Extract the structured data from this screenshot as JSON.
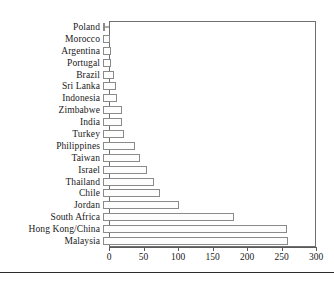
{
  "chart_data": {
    "type": "bar",
    "orientation": "horizontal",
    "title": "",
    "subtitle": "",
    "xlabel": "",
    "ylabel": "",
    "xlim": [
      0,
      300
    ],
    "ylim": null,
    "grid": false,
    "legend": null,
    "xticks": [
      0,
      50,
      100,
      150,
      200,
      250,
      300
    ],
    "xtick_labels": [
      "0",
      "50",
      "100",
      "150",
      "200",
      "250",
      "300"
    ],
    "categories": [
      "Poland",
      "Morocco",
      "Argentina",
      "Portugal",
      "Brazil",
      "Sri Lanka",
      "Indonesia",
      "Zimbabwe",
      "India",
      "Turkey",
      "Philippines",
      "Taiwan",
      "Israel",
      "Thailand",
      "Chile",
      "Jordan",
      "South Africa",
      "Hong Kong/China",
      "Malaysia"
    ],
    "values": [
      2,
      10,
      11,
      12,
      16,
      19,
      20,
      28,
      28,
      30,
      46,
      53,
      64,
      74,
      82,
      110,
      190,
      266,
      268
    ]
  }
}
